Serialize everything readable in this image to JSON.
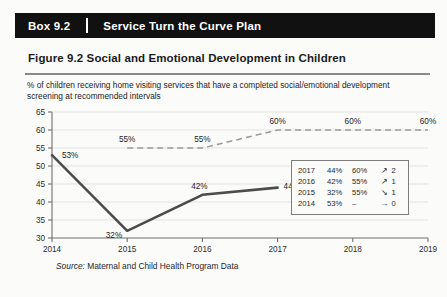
{
  "box": {
    "number": "Box 9.2",
    "title": "Service Turn the Curve Plan"
  },
  "figure": {
    "title": "Figure 9.2  Social and Emotional Development in Children",
    "subtitle": "% of children receiving home visiting services that have a completed social/emotional development screening at recommended intervals",
    "source_lead": "Source:",
    "source_text": " Maternal and Child Health Program Data"
  },
  "chart_data": {
    "type": "line",
    "title": "Figure 9.2  Social and Emotional Development in Children",
    "subtitle": "% of children receiving home visiting services that have a completed social/emotional development screening at recommended intervals",
    "xlabel": "",
    "ylabel": "",
    "x": [
      2014,
      2015,
      2016,
      2017,
      2018,
      2019
    ],
    "xticklabels": [
      "2014",
      "2015",
      "2016",
      "2017",
      "2018",
      "2019"
    ],
    "xlim": [
      2014,
      2019
    ],
    "ylim": [
      30,
      65
    ],
    "yticks": [
      30,
      35,
      40,
      45,
      50,
      55,
      60,
      65
    ],
    "yticklabels": [
      "30",
      "35",
      "40",
      "45",
      "50",
      "55",
      "60",
      "65"
    ],
    "grid": true,
    "legend": "none",
    "series": [
      {
        "name": "Actual",
        "style": "solid",
        "color": "#4c4c4c",
        "x": [
          2014,
          2015,
          2016,
          2017
        ],
        "values": [
          53,
          32,
          42,
          44
        ],
        "point_labels": [
          "53%",
          "32%",
          "42%",
          "44%"
        ]
      },
      {
        "name": "Target",
        "style": "dashed",
        "color": "#9a9a9a",
        "x": [
          2015,
          2016,
          2017,
          2018,
          2019
        ],
        "values": [
          55,
          55,
          60,
          60,
          60
        ],
        "point_labels": [
          "55%",
          "55%",
          "60%",
          "60%",
          "60%"
        ]
      }
    ]
  },
  "table": {
    "rows": [
      {
        "year": "2017",
        "actual": "44%",
        "target": "60%",
        "arrow": "↗",
        "count": "2"
      },
      {
        "year": "2016",
        "actual": "42%",
        "target": "55%",
        "arrow": "↗",
        "count": "1"
      },
      {
        "year": "2015",
        "actual": "32%",
        "target": "55%",
        "arrow": "↘",
        "count": "1"
      },
      {
        "year": "2014",
        "actual": "53%",
        "target": "–",
        "arrow": "→",
        "count": "0"
      }
    ]
  },
  "colors": {
    "header_bar": "#111111",
    "actual_line": "#4c4c4c",
    "target_line": "#9a9a9a",
    "page_bg": "#fbfbfa"
  }
}
